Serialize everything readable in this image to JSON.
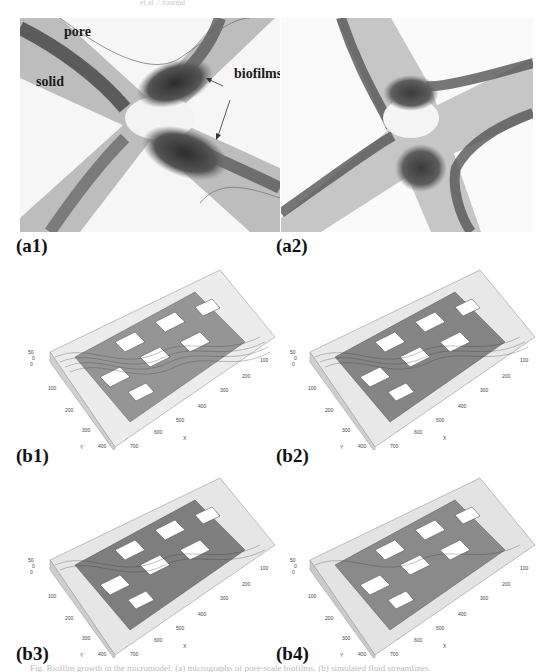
{
  "header": {
    "running_text": "et al. / Journal"
  },
  "panels_micrograph": [
    {
      "id": "a1",
      "label": "(a1)",
      "annotations": {
        "pore": "pore",
        "solid": "solid",
        "biofilms": "biofilms"
      }
    },
    {
      "id": "a2",
      "label": "(a2)"
    }
  ],
  "panels_3d": [
    {
      "id": "b1",
      "label": "(b1)",
      "biofilm_density": 0.25
    },
    {
      "id": "b2",
      "label": "(b2)",
      "biofilm_density": 0.45
    },
    {
      "id": "b3",
      "label": "(b3)",
      "biofilm_density": 0.65
    },
    {
      "id": "b4",
      "label": "(b4)",
      "biofilm_density": 0.9
    }
  ],
  "axes_3d": {
    "x_label": "X",
    "y_label": "Y",
    "z_ticks": [
      "50",
      "0"
    ],
    "y_ticks": [
      "0",
      "100",
      "200",
      "300",
      "400"
    ],
    "x_ticks": [
      "100",
      "200",
      "300",
      "400",
      "500",
      "600",
      "700"
    ]
  },
  "colors": {
    "background": "#ffffff",
    "pore_dark": "#4a4a4a",
    "pore_mid": "#9a9a9a",
    "solid": "#f4f4f4",
    "plot_fill": "#8c8c8c",
    "plot_line": "#3a3a3a"
  },
  "caption": {
    "text": "Fig. Biofilm growth in the micromodel: (a) micrographs of pore-scale biofilms, (b) simulated fluid streamlines."
  }
}
